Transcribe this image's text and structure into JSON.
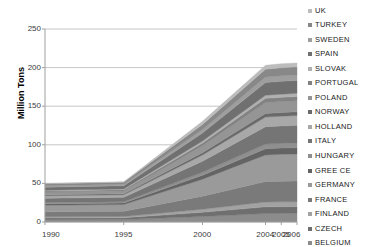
{
  "chart_data": {
    "type": "area",
    "stacked": true,
    "title": "",
    "xlabel": "",
    "ylabel": "Million Tons",
    "ylim": [
      0,
      250
    ],
    "yticks": [
      0,
      50,
      100,
      150,
      200,
      250
    ],
    "ytick_labels": [
      "0",
      "50",
      "100",
      "150",
      "200",
      "250"
    ],
    "grid": true,
    "grid_axis": "y",
    "legend_position": "right",
    "x": [
      "1990",
      "1995",
      "2000",
      "2004",
      "2005",
      "2006"
    ],
    "xtick_labels": [
      "1990",
      "1995",
      "2000",
      "2004",
      "2005",
      "2006"
    ],
    "total_values": [
      50,
      52,
      130,
      203,
      205,
      206
    ],
    "series": [
      {
        "name": "BELGIUM",
        "color": "#8c8c8c",
        "values": [
          3.0,
          3.1,
          7.0,
          11.0,
          11.1,
          11.2
        ]
      },
      {
        "name": "CZECH",
        "color": "#6f6f6f",
        "values": [
          2.2,
          2.3,
          5.5,
          8.6,
          8.7,
          8.7
        ]
      },
      {
        "name": "FINLAND",
        "color": "#a2a2a2",
        "values": [
          1.6,
          1.7,
          4.0,
          6.3,
          6.3,
          6.4
        ]
      },
      {
        "name": "FRANCE",
        "color": "#7a7a7a",
        "values": [
          6.5,
          6.7,
          17.0,
          26.5,
          26.8,
          26.9
        ]
      },
      {
        "name": "GERMANY",
        "color": "#9a9a9a",
        "values": [
          8.5,
          8.8,
          22.0,
          34.5,
          34.8,
          35.0
        ]
      },
      {
        "name": "GREE CE",
        "color": "#646464",
        "values": [
          2.0,
          2.1,
          5.0,
          8.0,
          8.1,
          8.1
        ]
      },
      {
        "name": "HUNGARY",
        "color": "#8f8f8f",
        "values": [
          1.5,
          1.6,
          3.8,
          6.0,
          6.0,
          6.1
        ]
      },
      {
        "name": "ITALY",
        "color": "#757575",
        "values": [
          5.5,
          5.7,
          14.5,
          22.5,
          22.7,
          22.8
        ]
      },
      {
        "name": "HOLLAND",
        "color": "#a8a8a8",
        "values": [
          3.2,
          3.3,
          8.0,
          12.5,
          12.6,
          12.7
        ]
      },
      {
        "name": "NORWAY",
        "color": "#6a6a6a",
        "values": [
          1.2,
          1.3,
          3.0,
          4.8,
          4.8,
          4.9
        ]
      },
      {
        "name": "POLAND",
        "color": "#959595",
        "values": [
          3.5,
          3.6,
          9.0,
          14.0,
          14.1,
          14.2
        ]
      },
      {
        "name": "PORTUGAL",
        "color": "#828282",
        "values": [
          1.4,
          1.5,
          3.5,
          5.5,
          5.5,
          5.6
        ]
      },
      {
        "name": "SLOVAK",
        "color": "#b0b0b0",
        "values": [
          1.0,
          1.1,
          2.6,
          4.0,
          4.1,
          4.1
        ]
      },
      {
        "name": "SPAIN",
        "color": "#707070",
        "values": [
          4.0,
          4.2,
          10.5,
          16.5,
          16.6,
          16.7
        ]
      },
      {
        "name": "SWEDEN",
        "color": "#9e9e9e",
        "values": [
          1.8,
          1.9,
          4.5,
          7.0,
          7.1,
          7.1
        ]
      },
      {
        "name": "TURKEY",
        "color": "#888888",
        "values": [
          2.6,
          2.7,
          6.5,
          10.3,
          10.4,
          10.5
        ]
      },
      {
        "name": "UK",
        "color": "#bcbcbc",
        "values": [
          0.5,
          0.4,
          4.1,
          5.0,
          5.3,
          5.0
        ]
      }
    ],
    "legend_entries": [
      "UK",
      "TURKEY",
      "SWEDEN",
      "SPAIN",
      "SLOVAK",
      "PORTUGAL",
      "POLAND",
      "NORWAY",
      "HOLLAND",
      "ITALY",
      "HUNGARY",
      "GREE CE",
      "GERMANY",
      "FRANCE",
      "FINLAND",
      "CZECH",
      "BELGIUM"
    ],
    "axis_color": "#a0a0a0",
    "grid_color": "#b8b8b8",
    "text_color": "#3a3a3a"
  }
}
